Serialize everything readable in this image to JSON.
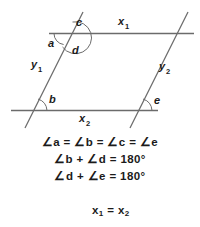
{
  "figure": {
    "type": "geometry-diagram",
    "stroke_color": "#6b6b6b",
    "text_color": "#1b1b1b",
    "background_color": "#ffffff",
    "lines": [
      {
        "name": "x1",
        "label": "x",
        "subscript": "1",
        "orientation": "horizontal",
        "position": "top"
      },
      {
        "name": "x2",
        "label": "x",
        "subscript": "2",
        "orientation": "horizontal",
        "position": "bottom"
      },
      {
        "name": "y1",
        "label": "y",
        "subscript": "1",
        "orientation": "transversal",
        "position": "left"
      },
      {
        "name": "y2",
        "label": "y",
        "subscript": "2",
        "orientation": "transversal",
        "position": "right"
      }
    ],
    "angles": [
      {
        "name": "a",
        "label": "a",
        "location": "top-left-intersection-left"
      },
      {
        "name": "c",
        "label": "c",
        "location": "top-left-intersection-upper-right"
      },
      {
        "name": "d",
        "label": "d",
        "location": "top-left-intersection-lower-right"
      },
      {
        "name": "b",
        "label": "b",
        "location": "bottom-left-intersection-upper-right"
      },
      {
        "name": "e",
        "label": "e",
        "location": "bottom-right-intersection-upper-right"
      }
    ]
  },
  "equations": {
    "line1": {
      "parts": [
        "∠",
        "a",
        " = ",
        "∠",
        "b",
        " = ",
        "∠",
        "c",
        " = ",
        "∠",
        "e"
      ],
      "text": "∠a = ∠b = ∠c = ∠e"
    },
    "line2": {
      "text": "∠b + ∠d = 180°"
    },
    "line3": {
      "text": "∠d + ∠e = 180°"
    },
    "line4": {
      "base1": "x",
      "sub1": "1",
      "op": "=",
      "base2": "x",
      "sub2": "2"
    },
    "line5": {
      "base1": "y",
      "sub1": "1",
      "op": "=",
      "base2": "y",
      "sub2": "2"
    }
  }
}
